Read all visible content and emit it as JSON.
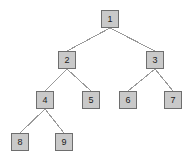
{
  "diagram": {
    "type": "tree",
    "background_color": "#ffffff",
    "node_fill_color": "#c9c9c9",
    "node_border_color": "#6e6e6e",
    "edge_color": "#9a9a9a",
    "label_color": "#1b1b1b",
    "node_size": 18,
    "canvas": {
      "width": 196,
      "height": 164
    }
  },
  "nodes": [
    {
      "id": "n1",
      "label": "1",
      "x": 110,
      "y": 19,
      "depth": 0,
      "parent": null
    },
    {
      "id": "n2",
      "label": "2",
      "x": 67,
      "y": 60,
      "depth": 1,
      "parent": "n1"
    },
    {
      "id": "n3",
      "label": "3",
      "x": 155,
      "y": 60,
      "depth": 1,
      "parent": "n1"
    },
    {
      "id": "n4",
      "label": "4",
      "x": 45,
      "y": 100,
      "depth": 2,
      "parent": "n2"
    },
    {
      "id": "n5",
      "label": "5",
      "x": 91,
      "y": 100,
      "depth": 2,
      "parent": "n2"
    },
    {
      "id": "n6",
      "label": "6",
      "x": 128,
      "y": 100,
      "depth": 2,
      "parent": "n3"
    },
    {
      "id": "n7",
      "label": "7",
      "x": 173,
      "y": 100,
      "depth": 2,
      "parent": "n3"
    },
    {
      "id": "n8",
      "label": "8",
      "x": 20,
      "y": 142,
      "depth": 3,
      "parent": "n4"
    },
    {
      "id": "n9",
      "label": "9",
      "x": 64,
      "y": 142,
      "depth": 3,
      "parent": "n4"
    }
  ],
  "edges": [
    {
      "from": "n1",
      "to": "n2"
    },
    {
      "from": "n1",
      "to": "n3"
    },
    {
      "from": "n2",
      "to": "n4"
    },
    {
      "from": "n2",
      "to": "n5"
    },
    {
      "from": "n3",
      "to": "n6"
    },
    {
      "from": "n3",
      "to": "n7"
    },
    {
      "from": "n4",
      "to": "n8"
    },
    {
      "from": "n4",
      "to": "n9"
    }
  ]
}
